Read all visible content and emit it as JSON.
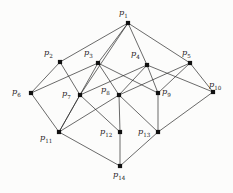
{
  "diagram": {
    "type": "hasse-diagram",
    "title": "",
    "background_color": "#fcfcfb",
    "node_color": "#111111",
    "edge_color": "#2b2b2b",
    "symbol": "p",
    "nodes": [
      {
        "id": "p1",
        "label": "p",
        "sub": "1",
        "x": 128,
        "y": 23,
        "label_x": 119,
        "label_y": 8,
        "label_align": "center"
      },
      {
        "id": "p2",
        "label": "p",
        "sub": "2",
        "x": 60,
        "y": 62,
        "label_x": 44,
        "label_y": 48,
        "label_align": "left"
      },
      {
        "id": "p3",
        "label": "p",
        "sub": "3",
        "x": 98,
        "y": 63,
        "label_x": 84,
        "label_y": 48,
        "label_align": "left"
      },
      {
        "id": "p4",
        "label": "p",
        "sub": "4",
        "x": 147,
        "y": 65,
        "label_x": 131,
        "label_y": 49,
        "label_align": "left"
      },
      {
        "id": "p5",
        "label": "p",
        "sub": "5",
        "x": 190,
        "y": 63,
        "label_x": 182,
        "label_y": 48,
        "label_align": "left"
      },
      {
        "id": "p6",
        "label": "p",
        "sub": "6",
        "x": 31,
        "y": 93,
        "label_x": 12,
        "label_y": 87,
        "label_align": "left"
      },
      {
        "id": "p7",
        "label": "p",
        "sub": "7",
        "x": 80,
        "y": 95,
        "label_x": 62,
        "label_y": 89,
        "label_align": "left"
      },
      {
        "id": "p8",
        "label": "p",
        "sub": "8",
        "x": 119,
        "y": 95,
        "label_x": 101,
        "label_y": 85,
        "label_align": "left"
      },
      {
        "id": "p9",
        "label": "p",
        "sub": "9",
        "x": 158,
        "y": 93,
        "label_x": 162,
        "label_y": 87,
        "label_align": "left"
      },
      {
        "id": "p10",
        "label": "p",
        "sub": "10",
        "x": 213,
        "y": 92,
        "label_x": 209,
        "label_y": 80,
        "label_align": "left"
      },
      {
        "id": "p11",
        "label": "p",
        "sub": "11",
        "x": 59,
        "y": 132,
        "label_x": 40,
        "label_y": 133,
        "label_align": "left"
      },
      {
        "id": "p12",
        "label": "p",
        "sub": "12",
        "x": 120,
        "y": 132,
        "label_x": 100,
        "label_y": 127,
        "label_align": "left"
      },
      {
        "id": "p13",
        "label": "p",
        "sub": "13",
        "x": 158,
        "y": 132,
        "label_x": 138,
        "label_y": 127,
        "label_align": "left"
      },
      {
        "id": "p14",
        "label": "p",
        "sub": "14",
        "x": 120,
        "y": 166,
        "label_x": 113,
        "label_y": 170,
        "label_align": "left"
      }
    ],
    "edges": [
      [
        "p1",
        "p2"
      ],
      [
        "p1",
        "p3"
      ],
      [
        "p1",
        "p4"
      ],
      [
        "p1",
        "p5"
      ],
      [
        "p1",
        "p7"
      ],
      [
        "p2",
        "p6"
      ],
      [
        "p2",
        "p7"
      ],
      [
        "p3",
        "p6"
      ],
      [
        "p3",
        "p8"
      ],
      [
        "p3",
        "p9"
      ],
      [
        "p3",
        "p11"
      ],
      [
        "p4",
        "p7"
      ],
      [
        "p4",
        "p8"
      ],
      [
        "p4",
        "p9"
      ],
      [
        "p4",
        "p10"
      ],
      [
        "p5",
        "p9"
      ],
      [
        "p5",
        "p10"
      ],
      [
        "p5",
        "p8"
      ],
      [
        "p6",
        "p11"
      ],
      [
        "p7",
        "p11"
      ],
      [
        "p7",
        "p12"
      ],
      [
        "p8",
        "p11"
      ],
      [
        "p8",
        "p12"
      ],
      [
        "p8",
        "p13"
      ],
      [
        "p9",
        "p13"
      ],
      [
        "p10",
        "p13"
      ],
      [
        "p11",
        "p14"
      ],
      [
        "p12",
        "p14"
      ],
      [
        "p13",
        "p14"
      ]
    ]
  }
}
